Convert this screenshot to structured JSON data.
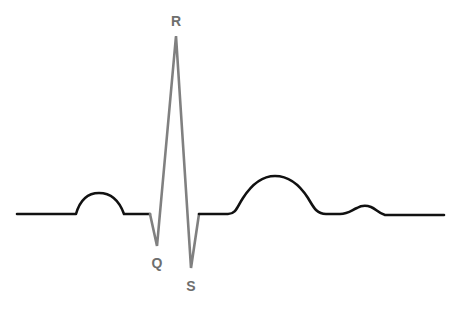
{
  "diagram": {
    "labels": {
      "r": "R",
      "q": "Q",
      "s": "S"
    },
    "colors": {
      "baseline": "#111111",
      "qrs": "#808080",
      "label": "#6e6e6e",
      "background": "#ffffff"
    },
    "segments": [
      {
        "name": "P wave",
        "shape": "bump",
        "x_start": 76,
        "x_end": 124,
        "peak_y": 193
      },
      {
        "name": "QRS complex",
        "points": {
          "Q": [
            157,
            246
          ],
          "R": [
            176,
            36
          ],
          "S": [
            191,
            268
          ]
        }
      },
      {
        "name": "T wave",
        "shape": "bump",
        "x_start": 230,
        "x_end": 320,
        "peak_y": 176
      },
      {
        "name": "U wave",
        "shape": "bump",
        "x_start": 345,
        "x_end": 385,
        "peak_y": 206
      }
    ],
    "baseline_y": 214
  }
}
